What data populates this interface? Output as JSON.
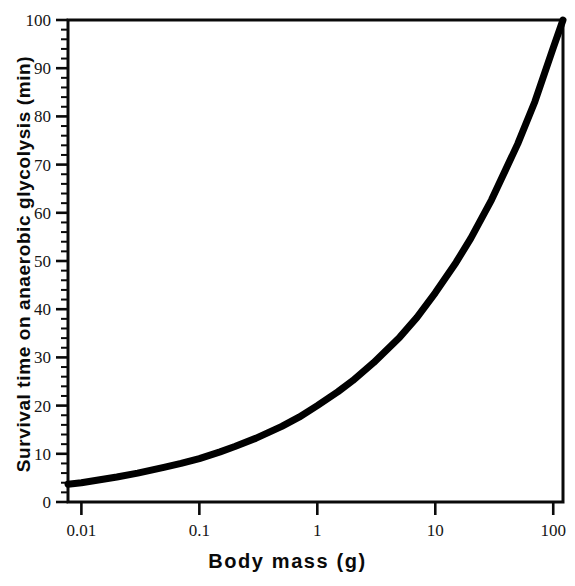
{
  "chart_data": {
    "type": "line",
    "title": "",
    "xlabel": "Body mass (g)",
    "ylabel": "Survival time on anaerobic glycolysis (min)",
    "xscale": "log",
    "yscale": "linear",
    "xlim": [
      0.0077,
      121
    ],
    "ylim": [
      0,
      100
    ],
    "grid": false,
    "legend": null,
    "xticks": [
      "0.01",
      "0.1",
      "1",
      "10",
      "100"
    ],
    "xtick_values": [
      0.01,
      0.1,
      1,
      10,
      100
    ],
    "yticks": [
      "0",
      "10",
      "20",
      "30",
      "40",
      "50",
      "60",
      "70",
      "80",
      "90",
      "100"
    ],
    "ytick_values": [
      0,
      10,
      20,
      30,
      40,
      50,
      60,
      70,
      80,
      90,
      100
    ],
    "yminor_step": 2,
    "line_color": "#000000",
    "line_width_px": 7,
    "series": [
      {
        "name": "Survival time",
        "x": [
          0.0077,
          0.01,
          0.02,
          0.03,
          0.05,
          0.07,
          0.1,
          0.15,
          0.2,
          0.3,
          0.5,
          0.7,
          1,
          1.5,
          2,
          3,
          5,
          7,
          10,
          15,
          20,
          30,
          50,
          70,
          100,
          121
        ],
        "y": [
          3.7,
          4.0,
          5.2,
          6.0,
          7.2,
          8.0,
          9.0,
          10.4,
          11.5,
          13.2,
          15.7,
          17.6,
          20.0,
          22.9,
          25.2,
          28.9,
          34.2,
          38.3,
          43.4,
          49.7,
          54.7,
          62.7,
          74.3,
          83.1,
          94.2,
          100.0
        ]
      }
    ],
    "annotations": []
  },
  "axes": {
    "x_title": "Body mass (g)",
    "y_title": "Survival time on anaerobic glycolysis (min)"
  }
}
